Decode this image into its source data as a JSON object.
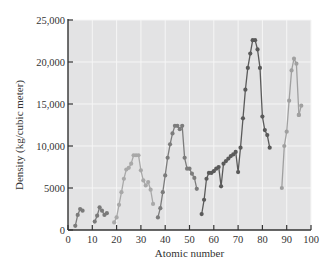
{
  "chart_data": {
    "type": "line",
    "title": "",
    "xlabel": "Atomic number",
    "ylabel": "Density (kg/cubic meter)",
    "xlim": [
      0,
      100
    ],
    "ylim": [
      0,
      25000
    ],
    "xticks": [
      0,
      10,
      20,
      30,
      40,
      50,
      60,
      70,
      80,
      90,
      100
    ],
    "xtick_labels": [
      "0",
      "10",
      "20",
      "30",
      "40",
      "50",
      "60",
      "70",
      "80",
      "90",
      "100"
    ],
    "yticks": [
      0,
      5000,
      10000,
      15000,
      20000,
      25000
    ],
    "ytick_labels": [
      "0",
      "5000",
      "10,000",
      "15,000",
      "20,000",
      "25,000"
    ],
    "grid": true,
    "legend": "none",
    "colors": {
      "plot_background": "#e3e3e4",
      "gridline": "#f6f6f6",
      "axis": "#333333",
      "period_2": "#7a7a7a",
      "period_3": "#7a7a7a",
      "period_4": "#a8a8a8",
      "period_5": "#7c7c7c",
      "period_6": "#5a5a5a",
      "period_7": "#a0a0a0"
    },
    "series": [
      {
        "name": "Period 2",
        "color_key": "period_2",
        "x": [
          3,
          4,
          5,
          6
        ],
        "y": [
          500,
          1800,
          2500,
          2300
        ]
      },
      {
        "name": "Period 3",
        "color_key": "period_3",
        "x": [
          11,
          12,
          13,
          14,
          15,
          16
        ],
        "y": [
          1000,
          1700,
          2700,
          2300,
          1800,
          2000
        ]
      },
      {
        "name": "Period 4",
        "color_key": "period_4",
        "x": [
          19,
          20,
          21,
          22,
          23,
          24,
          25,
          26,
          27,
          28,
          29,
          30,
          31,
          32,
          33,
          34,
          35
        ],
        "y": [
          900,
          1500,
          3000,
          4500,
          6100,
          7200,
          7400,
          7900,
          8900,
          8900,
          8900,
          7100,
          5900,
          5300,
          5700,
          4800,
          3100
        ]
      },
      {
        "name": "Period 5",
        "color_key": "period_5",
        "x": [
          37,
          38,
          39,
          40,
          41,
          42,
          43,
          44,
          45,
          46,
          47,
          48,
          49,
          50,
          51,
          52,
          53
        ],
        "y": [
          1500,
          2600,
          4500,
          6500,
          8600,
          10200,
          11500,
          12400,
          12400,
          12000,
          12400,
          8600,
          7300,
          7300,
          6700,
          6200,
          4900
        ]
      },
      {
        "name": "Period 6",
        "color_key": "period_6",
        "x": [
          55,
          56,
          57,
          58,
          59,
          60,
          61,
          62,
          63,
          64,
          65,
          66,
          67,
          68,
          69,
          70,
          71,
          72,
          73,
          74,
          75,
          76,
          77,
          78,
          79,
          80,
          81,
          82,
          83
        ],
        "y": [
          1900,
          3600,
          6100,
          6800,
          6800,
          7000,
          7300,
          7500,
          5200,
          7900,
          8200,
          8500,
          8800,
          9000,
          9300,
          6900,
          9800,
          13300,
          16700,
          19300,
          21000,
          22600,
          22600,
          21500,
          19300,
          13500,
          11900,
          11300,
          9800
        ]
      },
      {
        "name": "Period 7",
        "color_key": "period_7",
        "x": [
          88,
          89,
          90,
          91,
          92,
          93,
          94,
          95
        ],
        "y": [
          5000,
          10000,
          11700,
          15400,
          19000,
          20400,
          19800,
          13700
        ]
      },
      {
        "name": "Period 7 (cont.)",
        "color_key": "period_7",
        "x": [
          95,
          96
        ],
        "y": [
          13700,
          14800
        ]
      }
    ]
  }
}
